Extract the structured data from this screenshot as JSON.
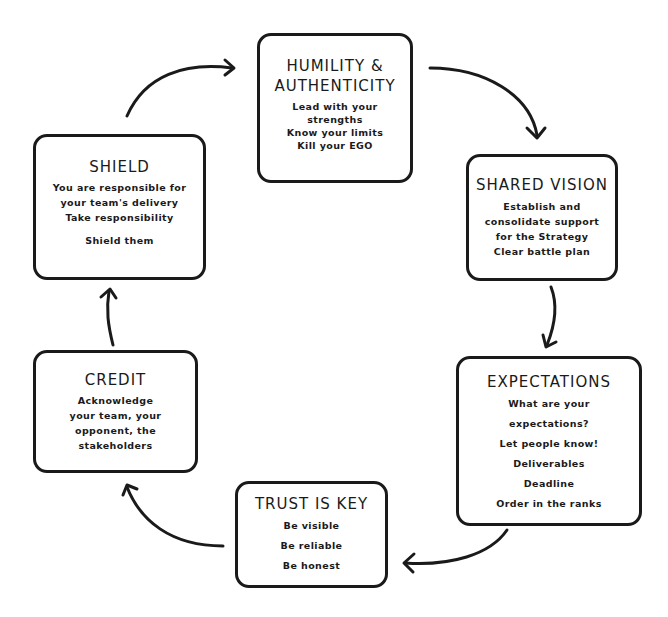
{
  "diagram": {
    "type": "cycle",
    "nodes": [
      {
        "id": "humility",
        "title_lines": [
          "HUMILITY &",
          "AUTHENTICITY"
        ],
        "lines": [
          "Lead with your",
          "strengths",
          "Know your limits",
          "Kill your EGO"
        ]
      },
      {
        "id": "shared_vision",
        "title_lines": [
          "SHARED VISION"
        ],
        "lines": [
          "Establish and",
          "consolidate support",
          "for the Strategy",
          "Clear battle plan"
        ]
      },
      {
        "id": "expectations",
        "title_lines": [
          "EXPECTATIONS"
        ],
        "lines": [
          "What are your",
          "expectations?",
          "Let people know!",
          "Deliverables",
          "Deadline",
          "Order in the ranks"
        ]
      },
      {
        "id": "trust",
        "title_lines": [
          "TRUST IS KEY"
        ],
        "lines": [
          "Be visible",
          "Be reliable",
          "Be honest"
        ]
      },
      {
        "id": "credit",
        "title_lines": [
          "CREDIT"
        ],
        "lines": [
          "Acknowledge",
          "your team, your",
          "opponent, the",
          "stakeholders"
        ]
      },
      {
        "id": "shield",
        "title_lines": [
          "SHIELD"
        ],
        "lines": [
          "You are responsible for",
          "your team's delivery",
          "Take responsibility",
          "",
          "Shield them"
        ]
      }
    ],
    "edges": [
      {
        "from": "shield",
        "to": "humility"
      },
      {
        "from": "humility",
        "to": "shared_vision"
      },
      {
        "from": "shared_vision",
        "to": "expectations"
      },
      {
        "from": "expectations",
        "to": "trust"
      },
      {
        "from": "trust",
        "to": "credit"
      },
      {
        "from": "credit",
        "to": "shield"
      }
    ]
  },
  "colors": {
    "stroke": "#1a1a1a",
    "background": "#ffffff"
  }
}
